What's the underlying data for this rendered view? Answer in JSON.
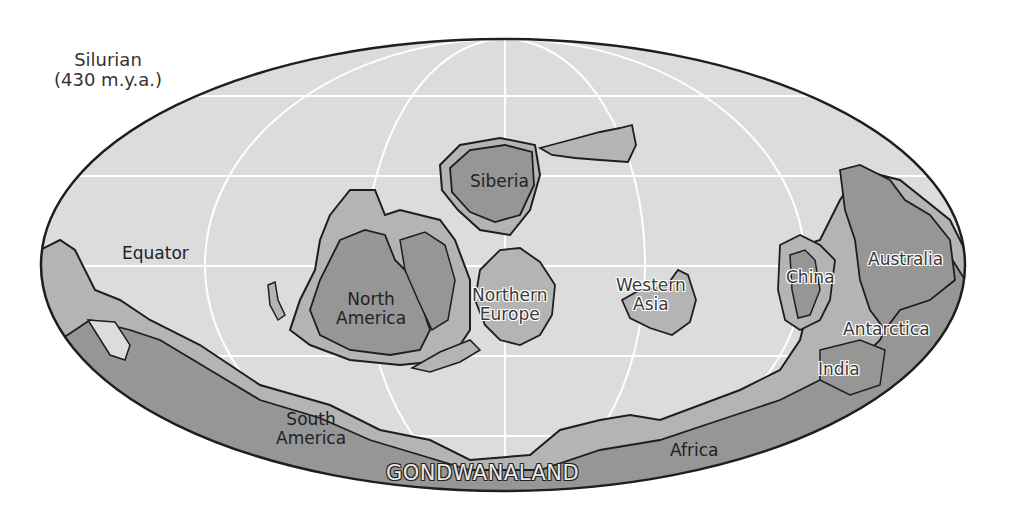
{
  "title": {
    "period": "Silurian",
    "age": "(430 m.y.a.)"
  },
  "labels": {
    "equator": "Equator",
    "siberia": "Siberia",
    "north_america_1": "North",
    "north_america_2": "America",
    "northern_europe_1": "Northern",
    "northern_europe_2": "Europe",
    "western_asia_1": "Western",
    "western_asia_2": "Asia",
    "china": "China",
    "australia": "Australia",
    "antarctica": "Antarctica",
    "india": "India",
    "south_america_1": "South",
    "south_america_2": "America",
    "africa": "Africa",
    "gondwanaland": "GONDWANALAND"
  },
  "colors": {
    "ocean": "#dcdcdc",
    "shelf": "#b4b4b4",
    "land": "#969696",
    "outline": "#1e1e1e",
    "graticule": "#ffffff",
    "background": "#ffffff"
  }
}
